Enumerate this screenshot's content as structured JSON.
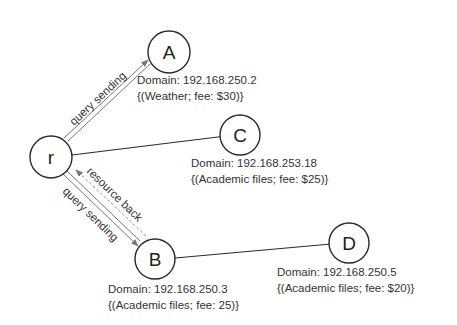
{
  "diagram": {
    "nodes": [
      {
        "id": "r",
        "label": "r"
      },
      {
        "id": "A",
        "label": "A",
        "domain": "Domain: 192.168.250.2",
        "resource": "{(Weather; fee: $30)}"
      },
      {
        "id": "C",
        "label": "C",
        "domain": "Domain: 192.168.253.18",
        "resource": "{(Academic files; fee: $25)}"
      },
      {
        "id": "B",
        "label": "B",
        "domain": "Domain: 192.168.250.3",
        "resource": "{(Academic files; fee: 25)}"
      },
      {
        "id": "D",
        "label": "D",
        "domain": "Domain: 192.168.250.5",
        "resource": "{(Academic files; fee: $20)}"
      }
    ],
    "edges": [
      {
        "from": "r",
        "to": "A",
        "label": "query sending"
      },
      {
        "from": "r",
        "to": "C"
      },
      {
        "from": "r",
        "to": "B",
        "label": "query sending"
      },
      {
        "from": "B",
        "to": "r",
        "label": "resource back"
      },
      {
        "from": "B",
        "to": "D"
      }
    ]
  }
}
